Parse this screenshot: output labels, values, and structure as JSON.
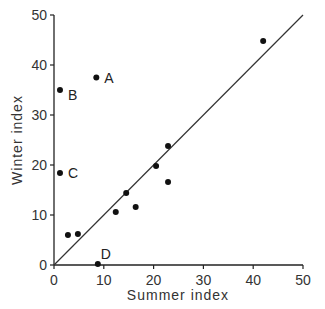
{
  "chart_data": {
    "type": "scatter",
    "title": "",
    "xlabel": "Summer index",
    "ylabel": "Winter index",
    "xlim": [
      0,
      50
    ],
    "ylim": [
      0,
      50
    ],
    "xticks": [
      0,
      10,
      20,
      30,
      40,
      50
    ],
    "yticks": [
      0,
      10,
      20,
      30,
      40,
      50
    ],
    "grid": false,
    "legend": null,
    "reference_line": {
      "type": "y=x",
      "from": [
        0,
        0
      ],
      "to": [
        50,
        50
      ]
    },
    "points": [
      {
        "x": 8.5,
        "y": 37.5,
        "label": "A"
      },
      {
        "x": 1.2,
        "y": 35.0,
        "label": "B"
      },
      {
        "x": 1.2,
        "y": 18.4,
        "label": "C"
      },
      {
        "x": 8.8,
        "y": 0.2,
        "label": "D"
      },
      {
        "x": 2.8,
        "y": 6.0,
        "label": ""
      },
      {
        "x": 4.8,
        "y": 6.2,
        "label": ""
      },
      {
        "x": 12.4,
        "y": 10.6,
        "label": ""
      },
      {
        "x": 14.5,
        "y": 14.4,
        "label": ""
      },
      {
        "x": 16.4,
        "y": 11.6,
        "label": ""
      },
      {
        "x": 20.5,
        "y": 19.8,
        "label": ""
      },
      {
        "x": 22.9,
        "y": 23.8,
        "label": ""
      },
      {
        "x": 22.9,
        "y": 16.6,
        "label": ""
      },
      {
        "x": 42.0,
        "y": 44.8,
        "label": ""
      }
    ]
  },
  "axes": {
    "x_title": "Summer index",
    "y_title": "Winter index",
    "x_tick_labels": [
      "0",
      "10",
      "20",
      "30",
      "40",
      "50"
    ],
    "y_tick_labels": [
      "0",
      "10",
      "20",
      "30",
      "40",
      "50"
    ]
  }
}
